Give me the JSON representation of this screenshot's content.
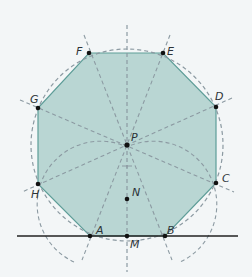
{
  "diagram": {
    "colors": {
      "background": "#f3f6f7",
      "fill": "#b9d6d3",
      "edge": "#5e9d98",
      "dashed": "#8c9aa2",
      "point": "#111111",
      "baseline": "#222222"
    },
    "points": {
      "A": {
        "label": "A",
        "x": 90,
        "y": 236
      },
      "B": {
        "label": "B",
        "x": 165,
        "y": 236
      },
      "C": {
        "label": "C",
        "x": 216,
        "y": 183
      },
      "D": {
        "label": "D",
        "x": 216,
        "y": 107
      },
      "E": {
        "label": "E",
        "x": 163,
        "y": 53
      },
      "F": {
        "label": "F",
        "x": 89,
        "y": 53
      },
      "G": {
        "label": "G",
        "x": 38,
        "y": 108
      },
      "H": {
        "label": "H",
        "x": 38,
        "y": 184
      },
      "M": {
        "label": "M",
        "x": 127,
        "y": 236
      },
      "N": {
        "label": "N",
        "x": 127,
        "y": 199
      },
      "P": {
        "label": "P",
        "x": 127,
        "y": 145
      }
    },
    "labels": [
      "A",
      "B",
      "C",
      "D",
      "E",
      "F",
      "G",
      "H",
      "M",
      "N",
      "P"
    ]
  }
}
